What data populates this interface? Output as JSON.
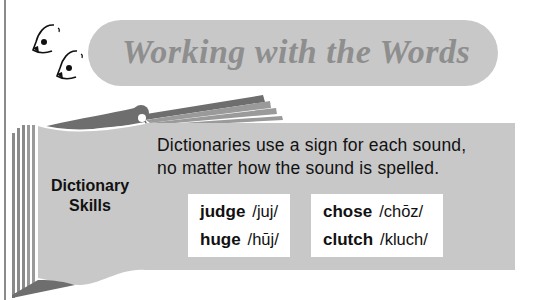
{
  "header": {
    "title": "Working with the Words",
    "icon": "mascot-birds-icon"
  },
  "section": {
    "label_line1": "Dictionary",
    "label_line2": "Skills",
    "instructions_line1": "Dictionaries use a sign for each sound,",
    "instructions_line2": "no matter how the sound is spelled."
  },
  "examples": {
    "left": [
      {
        "word": "judge",
        "pronunciation": "/juj/"
      },
      {
        "word": "huge",
        "pronunciation": "/hūj/"
      }
    ],
    "right": [
      {
        "word": "chose",
        "pronunciation": "/chōz/"
      },
      {
        "word": "clutch",
        "pronunciation": "/kluch/"
      }
    ]
  },
  "colors": {
    "banner": "#c8c8c8",
    "title": "#8e8e8e",
    "panel": "#c8c8c8",
    "book_dark": "#6e6e6e",
    "book_mid": "#9a9a9a"
  }
}
